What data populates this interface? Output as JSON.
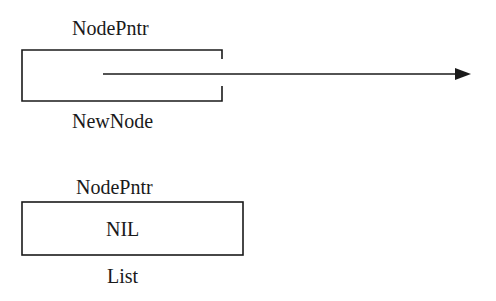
{
  "diagram": {
    "type": "pointer-diagram",
    "nodes": [
      {
        "id": "newnode",
        "type_label": "NodePntr",
        "name_label": "NewNode",
        "content": "",
        "points_to": "arrow-right"
      },
      {
        "id": "list",
        "type_label": "NodePntr",
        "name_label": "List",
        "content": "NIL"
      }
    ],
    "colors": {
      "ink": "#1a1a1a",
      "background": "#ffffff"
    }
  }
}
